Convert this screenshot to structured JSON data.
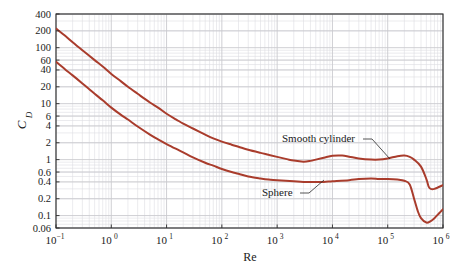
{
  "chart_data": {
    "type": "line",
    "title": "",
    "xlabel": "Re",
    "ylabel": "C_D",
    "ylabel_base": "C",
    "ylabel_sub": "D",
    "xscale": "log",
    "yscale": "log",
    "xlim": [
      0.1,
      1000000
    ],
    "ylim": [
      0.06,
      400
    ],
    "grid": true,
    "grid_minor": true,
    "legend": "inline-annotations",
    "line_color": "#a93c2c",
    "grid_color": "#c9c9ce",
    "grid_minor_color": "#dedee3",
    "axis_color": "#2b2b2b",
    "xtick_labels": [
      "10-1",
      "100",
      "101",
      "102",
      "103",
      "104",
      "105",
      "106"
    ],
    "xtick_mantissas": [
      "10",
      "10",
      "10",
      "10",
      "10",
      "10",
      "10",
      "10"
    ],
    "xtick_exponents": [
      "−1",
      "0",
      "1",
      "2",
      "3",
      "4",
      "5",
      "6"
    ],
    "xtick_values": [
      0.1,
      1,
      10,
      100,
      1000,
      10000,
      100000,
      1000000
    ],
    "ytick_labels": [
      "400",
      "200",
      "100",
      "60",
      "40",
      "20",
      "10",
      "6",
      "4",
      "2",
      "1",
      "0.6",
      "0.4",
      "0.2",
      "0.1",
      "0.06"
    ],
    "ytick_values": [
      400,
      200,
      100,
      60,
      40,
      20,
      10,
      6,
      4,
      2,
      1,
      0.6,
      0.4,
      0.2,
      0.1,
      0.06
    ],
    "annotations": [
      {
        "name": "smooth-cylinder",
        "text": "Smooth cylinder",
        "text_x": 282,
        "text_y": 142,
        "leader": [
          [
            363,
            139
          ],
          [
            372,
            139
          ],
          [
            390,
            159
          ]
        ]
      },
      {
        "name": "sphere",
        "text": "Sphere",
        "text_x": 262,
        "text_y": 196,
        "leader": [
          [
            300,
            193
          ],
          [
            309,
            193
          ],
          [
            324,
            180
          ]
        ]
      }
    ],
    "series": [
      {
        "name": "Smooth cylinder",
        "label": "Smooth cylinder",
        "color": "#a93c2c",
        "points": [
          [
            0.1,
            220
          ],
          [
            0.15,
            160
          ],
          [
            0.2,
            125
          ],
          [
            0.3,
            90
          ],
          [
            0.5,
            60
          ],
          [
            0.7,
            46
          ],
          [
            1.0,
            34
          ],
          [
            1.5,
            25
          ],
          [
            2.0,
            20
          ],
          [
            3.0,
            15
          ],
          [
            5.0,
            10.5
          ],
          [
            7.0,
            8.5
          ],
          [
            10,
            6.6
          ],
          [
            15,
            5.2
          ],
          [
            20,
            4.4
          ],
          [
            30,
            3.6
          ],
          [
            50,
            2.8
          ],
          [
            70,
            2.4
          ],
          [
            100,
            2.1
          ],
          [
            150,
            1.85
          ],
          [
            200,
            1.7
          ],
          [
            300,
            1.5
          ],
          [
            500,
            1.32
          ],
          [
            700,
            1.22
          ],
          [
            1000,
            1.12
          ],
          [
            1500,
            1.02
          ],
          [
            2000,
            0.96
          ],
          [
            3000,
            0.92
          ],
          [
            4000,
            0.95
          ],
          [
            5000,
            1.0
          ],
          [
            7000,
            1.08
          ],
          [
            10000,
            1.17
          ],
          [
            15000,
            1.18
          ],
          [
            20000,
            1.13
          ],
          [
            30000,
            1.05
          ],
          [
            50000,
            1.0
          ],
          [
            70000,
            1.0
          ],
          [
            100000,
            1.05
          ],
          [
            150000,
            1.15
          ],
          [
            200000,
            1.18
          ],
          [
            250000,
            1.12
          ],
          [
            300000,
            1.0
          ],
          [
            400000,
            0.75
          ],
          [
            500000,
            0.45
          ],
          [
            550000,
            0.33
          ],
          [
            600000,
            0.3
          ],
          [
            700000,
            0.3
          ],
          [
            1000000,
            0.35
          ]
        ]
      },
      {
        "name": "Sphere",
        "label": "Sphere",
        "color": "#a93c2c",
        "points": [
          [
            0.1,
            56
          ],
          [
            0.15,
            40
          ],
          [
            0.2,
            32
          ],
          [
            0.3,
            23
          ],
          [
            0.5,
            15
          ],
          [
            0.7,
            11.5
          ],
          [
            1.0,
            8.5
          ],
          [
            1.5,
            6.3
          ],
          [
            2.0,
            5.2
          ],
          [
            3.0,
            3.9
          ],
          [
            5.0,
            2.8
          ],
          [
            7.0,
            2.3
          ],
          [
            10,
            1.9
          ],
          [
            15,
            1.55
          ],
          [
            20,
            1.35
          ],
          [
            30,
            1.1
          ],
          [
            50,
            0.88
          ],
          [
            70,
            0.78
          ],
          [
            100,
            0.68
          ],
          [
            150,
            0.6
          ],
          [
            200,
            0.56
          ],
          [
            300,
            0.5
          ],
          [
            500,
            0.46
          ],
          [
            700,
            0.44
          ],
          [
            1000,
            0.43
          ],
          [
            2000,
            0.41
          ],
          [
            3000,
            0.4
          ],
          [
            5000,
            0.4
          ],
          [
            7000,
            0.4
          ],
          [
            10000,
            0.41
          ],
          [
            20000,
            0.43
          ],
          [
            30000,
            0.45
          ],
          [
            50000,
            0.46
          ],
          [
            70000,
            0.45
          ],
          [
            100000,
            0.45
          ],
          [
            150000,
            0.44
          ],
          [
            200000,
            0.42
          ],
          [
            250000,
            0.36
          ],
          [
            300000,
            0.2
          ],
          [
            350000,
            0.12
          ],
          [
            400000,
            0.09
          ],
          [
            500000,
            0.075
          ],
          [
            600000,
            0.08
          ],
          [
            700000,
            0.09
          ],
          [
            850000,
            0.11
          ],
          [
            1000000,
            0.13
          ]
        ]
      }
    ]
  }
}
